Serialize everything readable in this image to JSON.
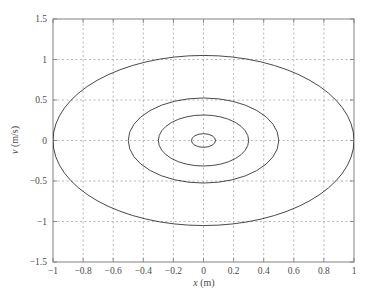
{
  "chart_data": {
    "type": "line",
    "title": "",
    "subtitle": "",
    "xlabel": "x (m)",
    "ylabel": "v (m/s)",
    "xlabel_italic": "x",
    "xlabel_unit": " (m)",
    "ylabel_italic": "v",
    "ylabel_unit": " (m/s)",
    "xlim": [
      -1,
      1
    ],
    "ylim": [
      -1.5,
      1.5
    ],
    "xticks": [
      -1,
      -0.8,
      -0.6,
      -0.4,
      -0.2,
      0,
      0.2,
      0.4,
      0.6,
      0.8,
      1
    ],
    "yticks": [
      -1.5,
      -1,
      -0.5,
      0,
      0.5,
      1,
      1.5
    ],
    "xtick_labels": [
      "−1",
      "−0.8",
      "−0.6",
      "−0.4",
      "−0.2",
      "0",
      "0.2",
      "0.4",
      "0.6",
      "0.8",
      "1"
    ],
    "ytick_labels": [
      "−1.5",
      "−1",
      "−0.5",
      "0",
      "0.5",
      "1",
      "1.5"
    ],
    "grid": true,
    "grid_style": "dashed",
    "grid_color": "#9a9a9a",
    "axis_color": "#808080",
    "curve_color": "#1a1a1a",
    "curve_width": 0.8,
    "legend": null,
    "legend_position": "none",
    "annotations": [],
    "series": [
      {
        "name": "orbit-1-outer",
        "shape": "ellipse",
        "center": [
          0,
          0
        ],
        "semi_x": 1.0,
        "semi_v": 1.05,
        "x_crossings": [
          -1.0,
          1.0
        ],
        "v_extrema": [
          -1.05,
          1.05
        ]
      },
      {
        "name": "orbit-2",
        "shape": "ellipse",
        "center": [
          0,
          0
        ],
        "semi_x": 0.5,
        "semi_v": 0.525,
        "x_crossings": [
          -0.5,
          0.5
        ],
        "v_extrema": [
          -0.525,
          0.525
        ]
      },
      {
        "name": "orbit-3",
        "shape": "ellipse",
        "center": [
          0,
          0
        ],
        "semi_x": 0.3,
        "semi_v": 0.315,
        "x_crossings": [
          -0.3,
          0.3
        ],
        "v_extrema": [
          -0.315,
          0.315
        ]
      },
      {
        "name": "orbit-4-inner",
        "shape": "ellipse",
        "center": [
          0,
          0
        ],
        "semi_x": 0.08,
        "semi_v": 0.084,
        "x_crossings": [
          -0.08,
          0.08
        ],
        "v_extrema": [
          -0.084,
          0.084
        ]
      }
    ]
  }
}
